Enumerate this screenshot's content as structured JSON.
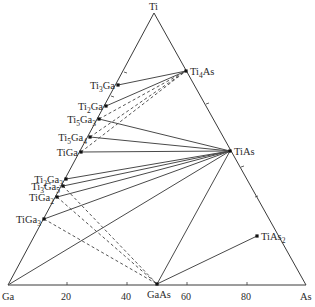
{
  "diagram": {
    "vertices": {
      "top": {
        "label": "Ti",
        "x": 154,
        "y": 13
      },
      "left": {
        "label": "Ga",
        "x": 8,
        "y": 285
      },
      "right": {
        "label": "As",
        "x": 306,
        "y": 285
      }
    },
    "bottom_axis_ticks": [
      {
        "label": "20",
        "x": 67
      },
      {
        "label": "40",
        "x": 127
      },
      {
        "label": "60",
        "x": 187
      },
      {
        "label": "80",
        "x": 247
      }
    ],
    "phases": [
      {
        "id": "Ti3Ga",
        "base": "Ti",
        "parts": [
          [
            "Ti",
            ""
          ],
          [
            "3",
            "sub"
          ],
          [
            "Ga",
            ""
          ]
        ],
        "x": 118,
        "y": 85,
        "side": "left"
      },
      {
        "id": "Ti2Ga",
        "parts": [
          [
            "Ti",
            ""
          ],
          [
            "2",
            "sub"
          ],
          [
            "Ga",
            ""
          ]
        ],
        "x": 106,
        "y": 106,
        "side": "left"
      },
      {
        "id": "Ti5Ga3",
        "parts": [
          [
            "Ti",
            ""
          ],
          [
            "5",
            "sub"
          ],
          [
            "Ga",
            ""
          ],
          [
            "3",
            "sub"
          ]
        ],
        "x": 99,
        "y": 119,
        "side": "left"
      },
      {
        "id": "Ti5Ga4",
        "parts": [
          [
            "Ti",
            ""
          ],
          [
            "5",
            "sub"
          ],
          [
            "Ga",
            ""
          ],
          [
            "4",
            "sub"
          ]
        ],
        "x": 90,
        "y": 137,
        "side": "left"
      },
      {
        "id": "TiGa",
        "parts": [
          [
            "TiGa",
            ""
          ]
        ],
        "x": 81,
        "y": 152,
        "side": "left"
      },
      {
        "id": "Ti2Ga3",
        "parts": [
          [
            "Ti",
            ""
          ],
          [
            "2",
            "sub"
          ],
          [
            "Ga",
            ""
          ],
          [
            "3",
            "sub"
          ]
        ],
        "x": 66,
        "y": 179,
        "side": "left"
      },
      {
        "id": "Ti3Ga5",
        "parts": [
          [
            "Ti",
            ""
          ],
          [
            "3",
            "sub"
          ],
          [
            "Ga",
            ""
          ],
          [
            "5",
            "sub"
          ]
        ],
        "x": 63,
        "y": 186,
        "side": "left"
      },
      {
        "id": "TiGa2",
        "parts": [
          [
            "TiGa",
            ""
          ],
          [
            "2",
            "sub"
          ]
        ],
        "x": 57,
        "y": 197,
        "side": "left"
      },
      {
        "id": "TiGa3",
        "parts": [
          [
            "TiGa",
            ""
          ],
          [
            "3",
            "sub"
          ]
        ],
        "x": 44,
        "y": 219,
        "side": "left"
      },
      {
        "id": "Ti4As",
        "parts": [
          [
            "Ti",
            ""
          ],
          [
            "4",
            "sub"
          ],
          [
            "As",
            ""
          ]
        ],
        "x": 186,
        "y": 71,
        "side": "right"
      },
      {
        "id": "TiAs",
        "parts": [
          [
            "TiAs",
            ""
          ]
        ],
        "x": 230,
        "y": 151,
        "side": "right"
      },
      {
        "id": "TiAs2",
        "parts": [
          [
            "TiAs",
            ""
          ],
          [
            "2",
            "sub"
          ]
        ],
        "x": 257,
        "y": 236,
        "side": "right"
      },
      {
        "id": "GaAs",
        "parts": [
          [
            "GaAs",
            ""
          ]
        ],
        "x": 157,
        "y": 284,
        "side": "bottom"
      }
    ],
    "tie_lines_solid": [
      [
        "Ti3Ga",
        "Ti4As"
      ],
      [
        "Ti2Ga",
        "Ti4As"
      ],
      [
        "Ti5Ga3",
        "TiAs"
      ],
      [
        "Ti5Ga4",
        "TiAs"
      ],
      [
        "TiGa",
        "TiAs"
      ],
      [
        "Ti2Ga3",
        "TiAs"
      ],
      [
        "Ti3Ga5",
        "TiAs"
      ],
      [
        "TiGa2",
        "TiAs"
      ],
      [
        "TiGa3",
        "TiAs"
      ],
      [
        "Ga",
        "TiAs"
      ],
      [
        "GaAs",
        "TiAs"
      ],
      [
        "GaAs",
        "TiAs2"
      ]
    ],
    "tie_lines_dashed": [
      [
        "Ti5Ga3",
        "Ti4As"
      ],
      [
        "Ti5Ga4",
        "Ti4As"
      ],
      [
        "TiGa",
        "Ti4As"
      ],
      [
        "Ti3Ga5",
        "GaAs"
      ],
      [
        "TiGa2",
        "GaAs"
      ],
      [
        "TiGa3",
        "GaAs"
      ]
    ],
    "tick_marks": {
      "left_side": [
        [
          124,
          72
        ],
        [
          111,
          96
        ]
      ],
      "right_side": [
        [
          209,
          103
        ],
        [
          244,
          166
        ],
        [
          258,
          196
        ]
      ]
    }
  }
}
